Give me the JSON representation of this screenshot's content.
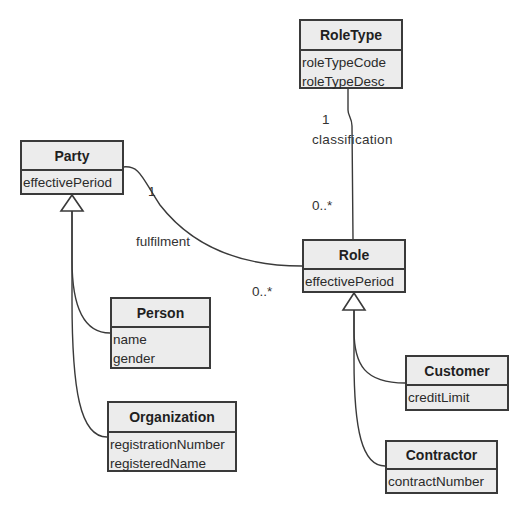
{
  "classes": {
    "roletype": {
      "name": "RoleType",
      "attributes": [
        "roleTypeCode",
        "roleTypeDesc"
      ]
    },
    "party": {
      "name": "Party",
      "attributes": [
        "effectivePeriod"
      ]
    },
    "role": {
      "name": "Role",
      "attributes": [
        "effectivePeriod"
      ]
    },
    "person": {
      "name": "Person",
      "attributes": [
        "name",
        "gender"
      ]
    },
    "organization": {
      "name": "Organization",
      "attributes": [
        "registrationNumber",
        "registeredName"
      ]
    },
    "customer": {
      "name": "Customer",
      "attributes": [
        "creditLimit"
      ]
    },
    "contractor": {
      "name": "Contractor",
      "attributes": [
        "contractNumber"
      ]
    }
  },
  "associations": {
    "classification": {
      "name": "classification",
      "source_multiplicity": "1",
      "target_multiplicity": "0..*"
    },
    "fulfilment": {
      "name": "fulfilment",
      "source_multiplicity": "1",
      "target_multiplicity": "0..*"
    }
  },
  "generalizations": [
    {
      "parent": "Party",
      "children": [
        "Person",
        "Organization"
      ]
    },
    {
      "parent": "Role",
      "children": [
        "Customer",
        "Contractor"
      ]
    }
  ]
}
